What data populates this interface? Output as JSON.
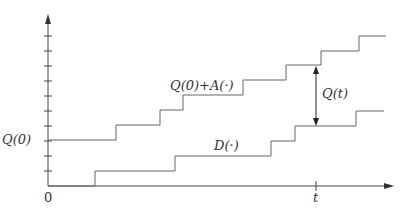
{
  "diagram": {
    "type": "queue-staircase",
    "labels": {
      "q0": "Q(0)",
      "arrivals": "Q(0)+A(·)",
      "departures": "D(·)",
      "qt": "Q(t)",
      "origin": "0",
      "t": "t"
    },
    "colors": {
      "line": "#555555",
      "axis": "#444444"
    },
    "y_ticks_count": 10,
    "arrivals_curve": [
      [
        48,
        140
      ],
      [
        116,
        140
      ],
      [
        116,
        125
      ],
      [
        160,
        125
      ],
      [
        160,
        110
      ],
      [
        183,
        110
      ],
      [
        183,
        95
      ],
      [
        243,
        95
      ],
      [
        243,
        80
      ],
      [
        286,
        80
      ],
      [
        286,
        65
      ],
      [
        321,
        65
      ],
      [
        321,
        51
      ],
      [
        359,
        51
      ],
      [
        359,
        36
      ],
      [
        386,
        36
      ]
    ],
    "departures_curve": [
      [
        48,
        186
      ],
      [
        95,
        186
      ],
      [
        95,
        171
      ],
      [
        175,
        171
      ],
      [
        175,
        156
      ],
      [
        271,
        156
      ],
      [
        271,
        141
      ],
      [
        295,
        141
      ],
      [
        295,
        126
      ],
      [
        356,
        126
      ],
      [
        356,
        111
      ],
      [
        384,
        111
      ]
    ]
  }
}
